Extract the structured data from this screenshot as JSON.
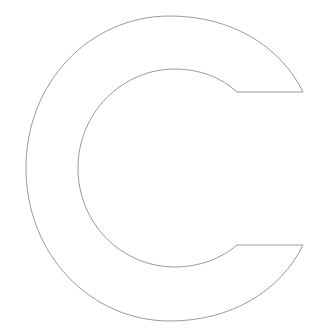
{
  "figure": {
    "shape": "letter-c-outline",
    "stroke_color": "#9a9a9a",
    "fill_color": "#ffffff",
    "background": "#ffffff",
    "label": "C"
  }
}
